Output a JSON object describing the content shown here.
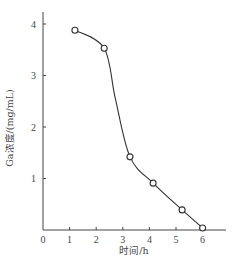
{
  "chart_data": {
    "type": "line",
    "title": "",
    "xlabel": "时间/h",
    "ylabel": "Ga浓度/(mg/mL)",
    "xlim": [
      0,
      6.8
    ],
    "ylim": [
      0,
      4.2
    ],
    "x_ticks": [
      "0",
      "1",
      "2",
      "3",
      "4",
      "5",
      "6"
    ],
    "y_ticks": [
      "1",
      "2",
      "3",
      "4"
    ],
    "grid": false,
    "legend": null,
    "series": [
      {
        "name": "Ga浓度",
        "marker": "open-circle",
        "line": "smooth",
        "x": [
          1.2,
          2.3,
          3.27,
          4.14,
          5.23,
          6.0
        ],
        "values": [
          3.88,
          3.53,
          1.42,
          0.91,
          0.39,
          0.04
        ]
      }
    ]
  },
  "colors": {
    "axis": "#444444",
    "line": "#333333"
  }
}
